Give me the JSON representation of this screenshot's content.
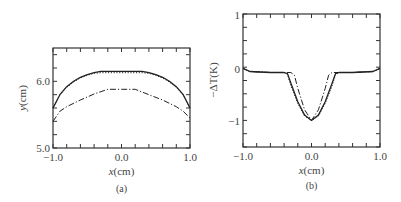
{
  "chart_data": [
    {
      "type": "line",
      "panel": "a",
      "caption": "(a)",
      "xlabel": "x (cm)",
      "ylabel": "y (cm)",
      "xlim": [
        -1.0,
        1.0
      ],
      "ylim": [
        5.0,
        6.5
      ],
      "xticks": [
        "-1.0",
        "0.0",
        "1.0"
      ],
      "yticks": [
        "5.0",
        "6.0"
      ],
      "grid": false,
      "series": [
        {
          "name": "solid",
          "style": "solid",
          "x": [
            -1.0,
            -0.9,
            -0.8,
            -0.7,
            -0.6,
            -0.5,
            -0.4,
            -0.3,
            0.0,
            0.3,
            0.4,
            0.5,
            0.6,
            0.7,
            0.8,
            0.9,
            1.0
          ],
          "y": [
            5.6,
            5.8,
            5.92,
            6.0,
            6.06,
            6.1,
            6.13,
            6.15,
            6.15,
            6.15,
            6.13,
            6.1,
            6.06,
            6.0,
            5.92,
            5.8,
            5.6
          ]
        },
        {
          "name": "dotted",
          "style": "dotted",
          "x": [
            -1.0,
            -0.9,
            -0.8,
            -0.7,
            -0.6,
            -0.5,
            -0.4,
            -0.3,
            0.0,
            0.3,
            0.4,
            0.5,
            0.6,
            0.7,
            0.8,
            0.9,
            1.0
          ],
          "y": [
            5.6,
            5.8,
            5.91,
            5.99,
            6.05,
            6.09,
            6.12,
            6.13,
            6.13,
            6.13,
            6.12,
            6.09,
            6.05,
            5.99,
            5.91,
            5.8,
            5.6
          ]
        },
        {
          "name": "dash-dot",
          "style": "dashdot",
          "x": [
            -1.0,
            -0.9,
            -0.8,
            -0.6,
            -0.4,
            -0.2,
            0.0,
            0.2,
            0.4,
            0.6,
            0.8,
            0.9,
            1.0
          ],
          "y": [
            5.4,
            5.55,
            5.62,
            5.72,
            5.81,
            5.88,
            5.88,
            5.88,
            5.8,
            5.72,
            5.62,
            5.55,
            5.45
          ]
        }
      ]
    },
    {
      "type": "line",
      "panel": "b",
      "caption": "(b)",
      "xlabel": "x (cm)",
      "ylabel": "-ΔT (K)",
      "xlim": [
        -1.0,
        1.0
      ],
      "ylim": [
        -1.5,
        1.0
      ],
      "xticks": [
        "-1.0",
        "0.0",
        "1.0"
      ],
      "yticks": [
        "1",
        "0",
        "-1"
      ],
      "grid": false,
      "series": [
        {
          "name": "solid",
          "style": "solid",
          "x": [
            -1.0,
            -0.9,
            -0.6,
            -0.4,
            -0.35,
            -0.3,
            -0.2,
            -0.1,
            0.0,
            0.1,
            0.2,
            0.3,
            0.35,
            0.4,
            0.6,
            0.9,
            1.0
          ],
          "y": [
            -0.02,
            -0.08,
            -0.1,
            -0.1,
            -0.12,
            -0.3,
            -0.65,
            -0.9,
            -1.0,
            -0.9,
            -0.65,
            -0.3,
            -0.12,
            -0.1,
            -0.1,
            -0.08,
            -0.02
          ]
        },
        {
          "name": "dotted",
          "style": "dotted",
          "x": [
            -1.0,
            -0.9,
            -0.6,
            -0.4,
            -0.35,
            -0.3,
            -0.2,
            -0.1,
            0.0,
            0.1,
            0.2,
            0.3,
            0.35,
            0.4,
            0.6,
            0.9,
            1.0
          ],
          "y": [
            -0.02,
            -0.08,
            -0.1,
            -0.1,
            -0.14,
            -0.35,
            -0.68,
            -0.92,
            -1.0,
            -0.92,
            -0.68,
            -0.35,
            -0.14,
            -0.1,
            -0.1,
            -0.08,
            -0.02
          ]
        },
        {
          "name": "dash-dot",
          "style": "dashdot",
          "x": [
            -1.0,
            -0.9,
            -0.6,
            -0.3,
            -0.25,
            -0.2,
            -0.1,
            0.0,
            0.1,
            0.2,
            0.25,
            0.3,
            0.6,
            0.9,
            1.0
          ],
          "y": [
            -0.02,
            -0.08,
            -0.1,
            -0.1,
            -0.15,
            -0.4,
            -0.8,
            -1.0,
            -0.8,
            -0.4,
            -0.15,
            -0.1,
            -0.1,
            -0.08,
            -0.02
          ]
        }
      ]
    }
  ],
  "labels": {
    "a": {
      "caption": "(a)",
      "xlabel": "x",
      "xunit": "(cm)",
      "ylabel": "y",
      "yunit": "(cm)",
      "xticks": [
        "−1.0",
        "0.0",
        "1.0"
      ],
      "yticks": [
        "5.0",
        "6.0"
      ]
    },
    "b": {
      "caption": "(b)",
      "xlabel": "x",
      "xunit": "(cm)",
      "ylabel": "−ΔT",
      "yunit": "(K)",
      "xticks": [
        "−1.0",
        "0.0",
        "1.0"
      ],
      "yticks": [
        "1",
        "0",
        "−1"
      ]
    }
  }
}
